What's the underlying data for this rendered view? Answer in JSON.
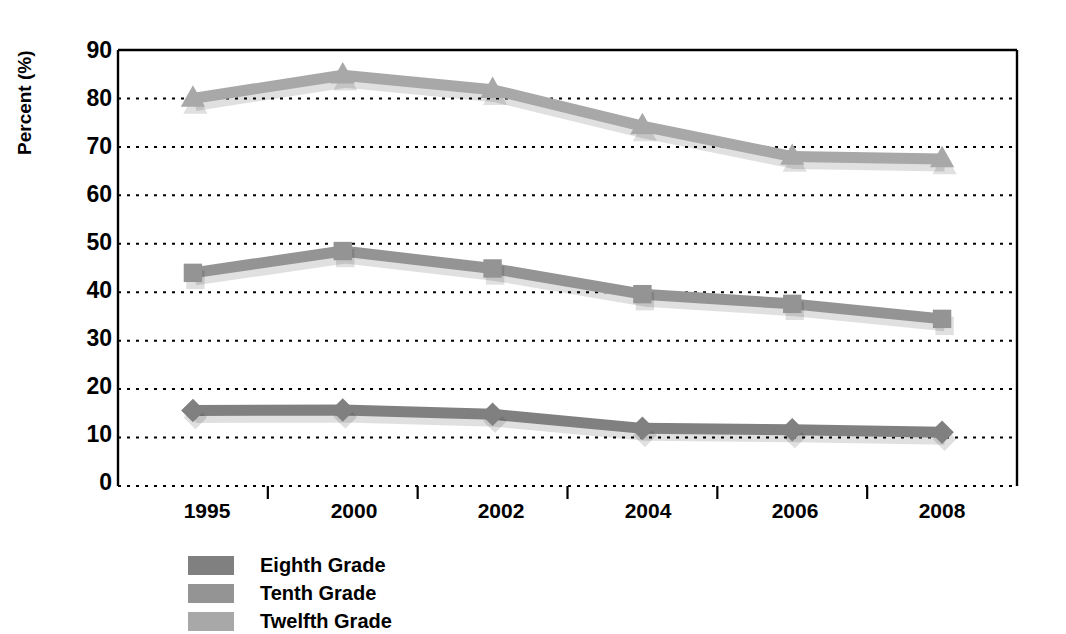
{
  "chart_data": {
    "type": "line",
    "title": "",
    "xlabel": "",
    "ylabel": "Percent (%)",
    "categories": [
      "1995",
      "2000",
      "2002",
      "2004",
      "2006",
      "2008"
    ],
    "ylim": [
      0,
      90
    ],
    "yticks": [
      0,
      10,
      20,
      30,
      40,
      50,
      60,
      70,
      80,
      90
    ],
    "grid": "horizontal-dotted",
    "legend_position": "bottom-left",
    "series": [
      {
        "name": "Eighth Grade",
        "marker": "diamond",
        "color": "#808080",
        "values": [
          15.6,
          15.7,
          14.8,
          11.9,
          11.6,
          11.1
        ]
      },
      {
        "name": "Tenth Grade",
        "marker": "square",
        "color": "#949494",
        "values": [
          44.0,
          48.5,
          44.9,
          39.6,
          37.6,
          34.5
        ]
      },
      {
        "name": "Twelfth Grade",
        "marker": "triangle",
        "color": "#a8a8a8",
        "values": [
          80.0,
          84.8,
          81.8,
          74.3,
          68.0,
          67.5
        ]
      }
    ]
  },
  "axis": {
    "y_title": "Percent (%)",
    "y_labels": [
      "90",
      "80",
      "70",
      "60",
      "50",
      "40",
      "30",
      "20",
      "10",
      "0"
    ],
    "x_labels": [
      "1995",
      "2000",
      "2002",
      "2004",
      "2006",
      "2008"
    ]
  },
  "legend": {
    "items": [
      {
        "label": "Eighth Grade",
        "color": "#808080"
      },
      {
        "label": "Tenth Grade",
        "color": "#949494"
      },
      {
        "label": "Twelfth Grade",
        "color": "#a8a8a8"
      }
    ]
  }
}
